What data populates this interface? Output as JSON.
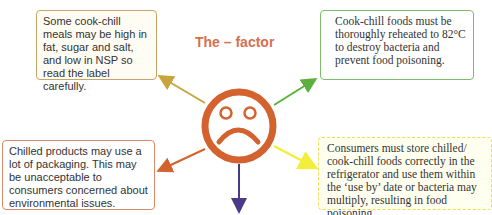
{
  "title": "The – factor",
  "center_icon": "sad-face-icon",
  "colors": {
    "face": "#d4622f",
    "arrow_top_left": "#c9a43a",
    "arrow_top_right": "#5cb03e",
    "arrow_bottom_left": "#d4622f",
    "arrow_bottom_right": "#f3ee3a",
    "arrow_down": "#4a3a88"
  },
  "boxes": [
    {
      "id": "nutrition",
      "text": "Some cook-chill meals may be high in fat, sugar and salt, and low in NSP so read the label carefully."
    },
    {
      "id": "reheating",
      "text": "Cook-chill foods must be thoroughly reheated to 82°C to destroy bacteria and prevent food poisoning."
    },
    {
      "id": "packaging",
      "text": "Chilled products may use a lot of packaging. This may be unacceptable to consumers concerned about environmental issues."
    },
    {
      "id": "storage",
      "text": "Consumers must store chilled/ cook-chill foods correctly in the refrigerator and use them within the ‘use by’ date or bacteria may multiply, resulting in food poisoning."
    }
  ]
}
